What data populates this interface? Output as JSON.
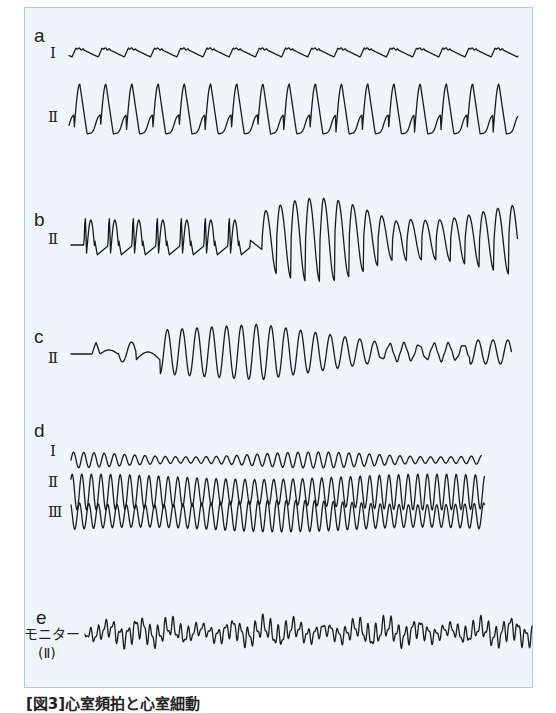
{
  "figure": {
    "caption": "[図3]心室頻拍と心室細動",
    "panel_background": "#eef6fa",
    "panel_border": "#a9cfe0",
    "trace_color": "#1b1b1b"
  },
  "panels": [
    {
      "id": "a",
      "label": "a",
      "leads": [
        "Ⅰ",
        "Ⅱ"
      ]
    },
    {
      "id": "b",
      "label": "b",
      "leads": [
        "Ⅱ"
      ]
    },
    {
      "id": "c",
      "label": "c",
      "leads": [
        "Ⅱ"
      ]
    },
    {
      "id": "d",
      "label": "d",
      "leads": [
        "Ⅰ",
        "Ⅱ",
        "Ⅲ"
      ]
    },
    {
      "id": "e",
      "label": "e",
      "leads": [
        "モニター",
        "(Ⅱ)"
      ]
    }
  ]
}
